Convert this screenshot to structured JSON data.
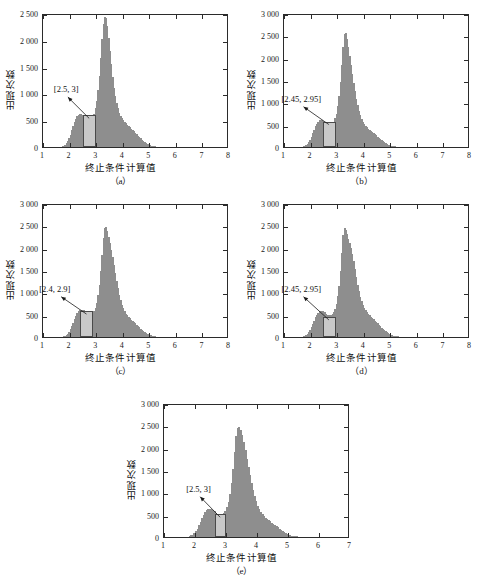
{
  "figure": {
    "background": "#ffffff",
    "bar_color": "#8e8e8e",
    "highlight_fill": "#c9c9c9",
    "highlight_stroke": "#4a4a4a",
    "axis_color": "#2b2b2b",
    "axis_title_x": "终止条件计算值",
    "axis_title_y": "出现次数"
  },
  "chart_data": [
    {
      "id": "a",
      "type": "bar",
      "caption": "（a）",
      "title": "",
      "xlabel": "终止条件计算值",
      "ylabel": "出现次数",
      "xlim": [
        1,
        8
      ],
      "ylim": [
        0,
        2500
      ],
      "xticks": [
        1,
        2,
        3,
        4,
        5,
        6,
        7,
        8
      ],
      "xticklabels": [
        "1",
        "2",
        "3",
        "4",
        "5",
        "6",
        "7",
        "8"
      ],
      "yticks": [
        0,
        500,
        1000,
        1500,
        2000,
        2500
      ],
      "yticklabels": [
        "0",
        "500",
        "1 000",
        "1 500",
        "2 000",
        "2 500"
      ],
      "grid": false,
      "legend": "none",
      "annotation": "[2.5, 3]",
      "highlight_range": [
        2.5,
        3.0
      ],
      "highlight_height": 590,
      "bin_width": 0.05,
      "bin_start": 1.6,
      "values": [
        4,
        8,
        14,
        26,
        44,
        72,
        112,
        165,
        232,
        310,
        390,
        468,
        530,
        575,
        600,
        612,
        608,
        592,
        566,
        535,
        508,
        492,
        488,
        498,
        520,
        560,
        625,
        720,
        860,
        1060,
        1330,
        1660,
        2020,
        2300,
        2430,
        2400,
        2255,
        2040,
        1790,
        1540,
        1310,
        1110,
        950,
        820,
        720,
        640,
        580,
        535,
        500,
        470,
        445,
        420,
        395,
        370,
        345,
        320,
        292,
        265,
        238,
        212,
        186,
        160,
        136,
        114,
        94,
        76,
        60,
        47,
        36,
        27,
        20,
        14,
        10,
        7,
        5,
        3,
        2,
        2,
        1,
        1,
        1,
        0,
        0,
        0,
        0,
        0,
        0,
        0,
        0,
        0,
        0,
        0,
        0,
        0,
        0,
        0,
        0,
        0,
        0,
        0,
        0,
        0,
        0,
        0,
        0,
        0,
        0,
        0,
        0,
        0,
        0,
        0,
        0,
        0,
        0,
        0,
        0,
        0,
        0,
        0,
        0,
        0,
        0,
        0,
        0,
        0,
        0,
        0,
        0,
        0,
        0,
        0,
        0,
        0,
        0,
        0,
        0,
        0,
        0,
        0
      ]
    },
    {
      "id": "b",
      "type": "bar",
      "caption": "（b）",
      "title": "",
      "xlabel": "终止条件计算值",
      "ylabel": "出现次数",
      "xlim": [
        1,
        8
      ],
      "ylim": [
        0,
        3000
      ],
      "xticks": [
        1,
        2,
        3,
        4,
        5,
        6,
        7,
        8
      ],
      "xticklabels": [
        "1",
        "2",
        "3",
        "4",
        "5",
        "6",
        "7",
        "8"
      ],
      "yticks": [
        0,
        500,
        1000,
        1500,
        2000,
        2500,
        3000
      ],
      "yticklabels": [
        "0",
        "500",
        "1 000",
        "1 500",
        "2 000",
        "2 500",
        "3 000"
      ],
      "grid": false,
      "legend": "none",
      "annotation": "[2.45, 2.95]",
      "highlight_range": [
        2.45,
        2.95
      ],
      "highlight_height": 570,
      "bin_width": 0.05,
      "bin_start": 1.6,
      "values": [
        3,
        7,
        13,
        24,
        42,
        70,
        110,
        162,
        228,
        305,
        385,
        462,
        524,
        568,
        596,
        608,
        604,
        588,
        562,
        532,
        506,
        490,
        486,
        496,
        520,
        565,
        640,
        750,
        910,
        1140,
        1450,
        1830,
        2230,
        2520,
        2560,
        2420,
        2240,
        2040,
        1840,
        1640,
        1440,
        1250,
        1080,
        930,
        810,
        710,
        630,
        565,
        515,
        475,
        442,
        412,
        386,
        360,
        336,
        312,
        286,
        260,
        232,
        204,
        178,
        152,
        128,
        106,
        86,
        69,
        54,
        42,
        32,
        24,
        18,
        13,
        9,
        6,
        5,
        4,
        3,
        3,
        2,
        2,
        1,
        1,
        1,
        1,
        0,
        0,
        0,
        0,
        0,
        0,
        0,
        0,
        0,
        0,
        0,
        0,
        0,
        0,
        0,
        0,
        0,
        0,
        0,
        0,
        0,
        0,
        0,
        0,
        0,
        0,
        0,
        0,
        0,
        0,
        0,
        0,
        0,
        0,
        0,
        0,
        0,
        0,
        0,
        0,
        0,
        0,
        0,
        0,
        0,
        0,
        0,
        0,
        0,
        0,
        0
      ]
    },
    {
      "id": "c",
      "type": "bar",
      "caption": "（c）",
      "title": "",
      "xlabel": "终止条件计算值",
      "ylabel": "出现次数",
      "xlim": [
        1,
        8
      ],
      "ylim": [
        0,
        3000
      ],
      "xticks": [
        1,
        2,
        3,
        4,
        5,
        6,
        7,
        8
      ],
      "xticklabels": [
        "1",
        "2",
        "3",
        "4",
        "5",
        "6",
        "7",
        "8"
      ],
      "yticks": [
        0,
        500,
        1000,
        1500,
        2000,
        2500,
        3000
      ],
      "yticklabels": [
        "0",
        "500",
        "1 000",
        "1 500",
        "2 000",
        "2 500",
        "3 000"
      ],
      "grid": false,
      "legend": "none",
      "annotation": "[2.4, 2.9]",
      "highlight_range": [
        2.4,
        2.9
      ],
      "highlight_height": 580,
      "bin_width": 0.05,
      "bin_start": 1.65,
      "values": [
        4,
        9,
        16,
        28,
        48,
        78,
        120,
        172,
        240,
        318,
        396,
        470,
        530,
        576,
        604,
        616,
        612,
        596,
        570,
        540,
        515,
        498,
        494,
        504,
        528,
        572,
        650,
        760,
        930,
        1160,
        1470,
        1840,
        2220,
        2440,
        2470,
        2380,
        2250,
        2100,
        1950,
        1790,
        1620,
        1440,
        1260,
        1090,
        940,
        820,
        720,
        640,
        575,
        525,
        485,
        450,
        420,
        392,
        364,
        336,
        308,
        278,
        248,
        218,
        190,
        162,
        136,
        112,
        92,
        74,
        58,
        45,
        34,
        25,
        18,
        13,
        9,
        7,
        5,
        4,
        3,
        3,
        2,
        2,
        2,
        1,
        1,
        1,
        1,
        0,
        0,
        0,
        0,
        0,
        0,
        0,
        0,
        0,
        0,
        0,
        0,
        0,
        0,
        0,
        0,
        0,
        0,
        0,
        0,
        0,
        0,
        0,
        0,
        0,
        0,
        0,
        0,
        0,
        0,
        0,
        0,
        0,
        0,
        0,
        0,
        0,
        0,
        0,
        0,
        0,
        0,
        0,
        0,
        0,
        0,
        0,
        0,
        0
      ]
    },
    {
      "id": "d",
      "type": "bar",
      "caption": "（d）",
      "title": "",
      "xlabel": "终止条件计算值",
      "ylabel": "出现次数",
      "xlim": [
        1,
        8
      ],
      "ylim": [
        0,
        3000
      ],
      "xticks": [
        1,
        2,
        3,
        4,
        5,
        6,
        7,
        8
      ],
      "xticklabels": [
        "1",
        "2",
        "3",
        "4",
        "5",
        "6",
        "7",
        "8"
      ],
      "yticks": [
        0,
        500,
        1000,
        1500,
        2000,
        2500,
        3000
      ],
      "yticklabels": [
        "0",
        "500",
        "1 000",
        "1 500",
        "2 000",
        "2 500",
        "3 000"
      ],
      "grid": false,
      "legend": "none",
      "annotation": "[2.45, 2.95]",
      "highlight_range": [
        2.45,
        2.95
      ],
      "highlight_height": 450,
      "bin_width": 0.05,
      "bin_start": 1.6,
      "values": [
        3,
        7,
        12,
        22,
        40,
        66,
        104,
        154,
        218,
        292,
        368,
        442,
        502,
        548,
        578,
        592,
        590,
        576,
        552,
        524,
        500,
        486,
        482,
        492,
        516,
        560,
        636,
        746,
        910,
        1150,
        1480,
        1880,
        2280,
        2450,
        2400,
        2300,
        2200,
        2100,
        1990,
        1860,
        1700,
        1520,
        1340,
        1170,
        1020,
        900,
        800,
        720,
        656,
        604,
        560,
        522,
        488,
        456,
        426,
        396,
        366,
        336,
        304,
        272,
        240,
        208,
        178,
        150,
        124,
        102,
        83,
        66,
        52,
        40,
        30,
        23,
        17,
        13,
        10,
        8,
        6,
        5,
        4,
        3,
        3,
        2,
        2,
        2,
        1,
        1,
        1,
        1,
        0,
        0,
        0,
        0,
        0,
        0,
        0,
        0,
        0,
        0,
        0,
        0,
        0,
        0,
        0,
        0,
        0,
        0,
        0,
        0,
        0,
        0,
        0,
        0,
        0,
        0,
        0,
        0,
        0,
        0,
        0,
        0,
        0,
        0,
        0,
        0,
        0,
        0,
        0,
        0,
        0,
        0,
        0,
        0
      ]
    },
    {
      "id": "e",
      "type": "bar",
      "caption": "（e）",
      "title": "",
      "xlabel": "终止条件计算值",
      "ylabel": "出现次数",
      "xlim": [
        1,
        7
      ],
      "ylim": [
        0,
        3000
      ],
      "xticks": [
        1,
        2,
        3,
        4,
        5,
        6,
        7
      ],
      "xticklabels": [
        "1",
        "2",
        "3",
        "4",
        "5",
        "6",
        "7"
      ],
      "yticks": [
        0,
        500,
        1000,
        1500,
        2000,
        2500,
        3000
      ],
      "yticklabels": [
        "0",
        "500",
        "1 000",
        "1 500",
        "2 000",
        "2 500",
        "3 000"
      ],
      "grid": false,
      "legend": "none",
      "annotation": "[2.5, 3]",
      "highlight_range": [
        2.65,
        3.0
      ],
      "highlight_height": 510,
      "bin_width": 0.05,
      "bin_start": 1.7,
      "values": [
        5,
        11,
        20,
        34,
        56,
        88,
        132,
        190,
        262,
        342,
        422,
        494,
        552,
        594,
        618,
        626,
        620,
        602,
        576,
        546,
        520,
        504,
        500,
        512,
        540,
        590,
        672,
        790,
        960,
        1200,
        1520,
        1900,
        2260,
        2450,
        2470,
        2400,
        2280,
        2120,
        1940,
        1750,
        1560,
        1380,
        1210,
        1050,
        910,
        796,
        700,
        622,
        558,
        508,
        468,
        434,
        404,
        376,
        350,
        324,
        298,
        270,
        242,
        214,
        186,
        158,
        132,
        108,
        88,
        70,
        55,
        43,
        33,
        25,
        19,
        14,
        10,
        8,
        6,
        5,
        4,
        3,
        3,
        2,
        2,
        2,
        1,
        1,
        1,
        1,
        0,
        0,
        0,
        0,
        0,
        0,
        0,
        0,
        0,
        0,
        0,
        0,
        0,
        0,
        0,
        0,
        0,
        0,
        0,
        0,
        0,
        0,
        0,
        0,
        0,
        0,
        0,
        0,
        0
      ]
    }
  ]
}
